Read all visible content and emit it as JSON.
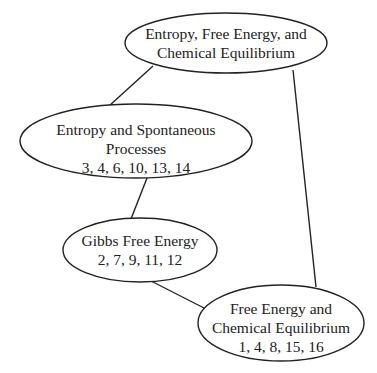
{
  "diagram": {
    "type": "concept-map",
    "nodes": [
      {
        "id": "root",
        "lines": [
          "Entropy, Free Energy, and",
          "Chemical Equilibrium"
        ]
      },
      {
        "id": "entropy",
        "lines": [
          "Entropy and Spontaneous",
          "Processes",
          "3, 4, 6, 10, 13, 14"
        ]
      },
      {
        "id": "gibbs",
        "lines": [
          "Gibbs Free Energy",
          "2, 7, 9, 11, 12"
        ]
      },
      {
        "id": "equilibrium",
        "lines": [
          "Free Energy and",
          "Chemical Equilibrium",
          "1, 4, 8, 15, 16"
        ]
      }
    ],
    "edges": [
      {
        "from": "root",
        "to": "entropy"
      },
      {
        "from": "entropy",
        "to": "gibbs"
      },
      {
        "from": "gibbs",
        "to": "equilibrium"
      },
      {
        "from": "root",
        "to": "equilibrium"
      }
    ]
  }
}
